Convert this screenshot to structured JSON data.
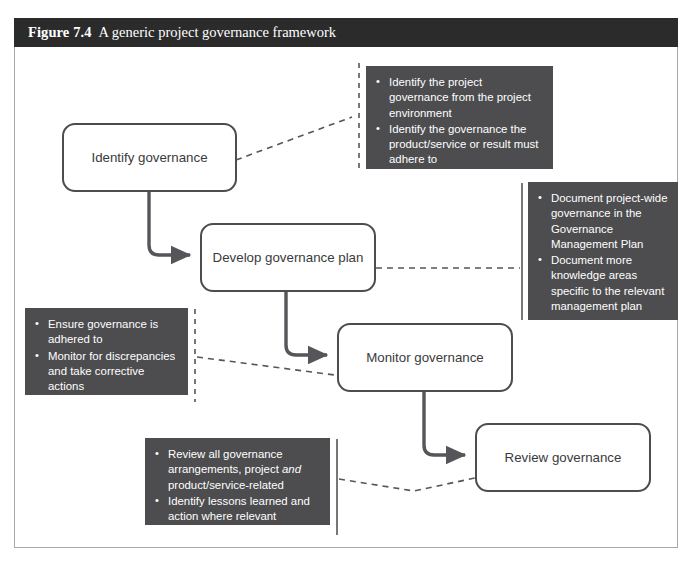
{
  "figure": {
    "number": "Figure 7.4",
    "caption": "A generic project governance framework"
  },
  "colors": {
    "titlebar_bg": "#2b2b2b",
    "callout_bg": "#4d4d4f",
    "node_border": "#4d4d4f",
    "node_text": "#3a3a3c",
    "frame_border": "#a9a9ad",
    "page_bg": "#ffffff",
    "connector": "#55555a"
  },
  "nodes": [
    {
      "id": "identify",
      "label": "Identify governance"
    },
    {
      "id": "develop",
      "label": "Develop governance plan"
    },
    {
      "id": "monitor",
      "label": "Monitor governance"
    },
    {
      "id": "review",
      "label": "Review governance"
    }
  ],
  "callouts": [
    {
      "id": "identify-callout",
      "attached_to": "Identify governance",
      "items": [
        "Identify the project governance from the project environment",
        "Identify the governance the product/service or result must adhere to"
      ]
    },
    {
      "id": "develop-callout",
      "attached_to": "Develop governance plan",
      "items": [
        "Document project-wide governance in the Governance Management Plan",
        "Document more knowledge areas specific to the relevant management plan"
      ]
    },
    {
      "id": "monitor-callout",
      "attached_to": "Monitor governance",
      "items": [
        "Ensure governance is adhered to",
        "Monitor for discrepancies and take corrective actions"
      ]
    },
    {
      "id": "review-callout",
      "attached_to": "Review governance",
      "items_html": [
        "Review all governance arrangements, project <em>and</em> product/service-related",
        "Identify lessons learned and action where relevant"
      ]
    }
  ],
  "flow": {
    "sequence": [
      "Identify governance",
      "Develop governance plan",
      "Monitor governance",
      "Review governance"
    ],
    "connector_style": "solid-elbow-arrow",
    "leader_style": "dashed"
  },
  "bullet_glyph": "•"
}
